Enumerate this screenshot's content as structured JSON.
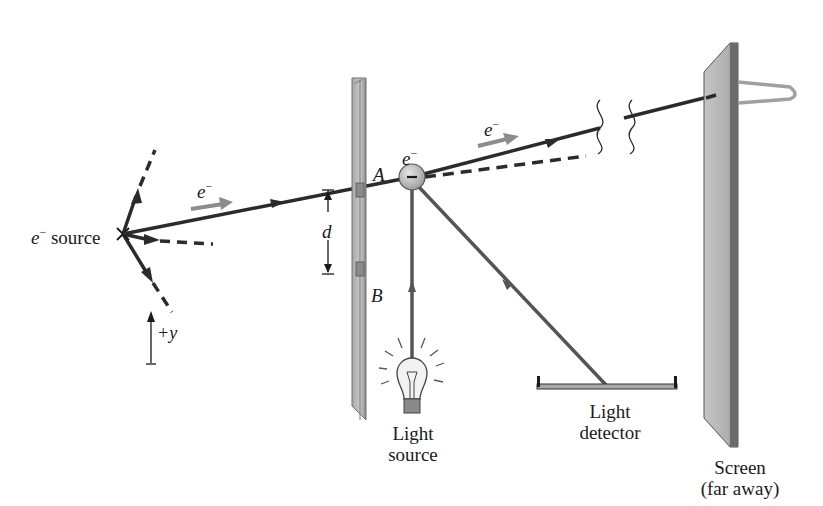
{
  "diagram": {
    "labels": {
      "source": {
        "symbol": "e",
        "superscript": "−",
        "text": "source"
      },
      "electron_incoming": {
        "symbol": "e",
        "superscript": "−"
      },
      "electron_at_detect": {
        "symbol": "e",
        "superscript": "−"
      },
      "electron_outgoing": {
        "symbol": "e",
        "superscript": "−"
      },
      "slit_a": "A",
      "slit_b": "B",
      "slit_separation": "d",
      "axis": "+y",
      "light_source_line1": "Light",
      "light_source_line2": "source",
      "light_detector_line1": "Light",
      "light_detector_line2": "detector",
      "screen_line1": "Screen",
      "screen_line2": "(far away)",
      "electron_charge_sign": "−"
    },
    "colors": {
      "line": "#2b2b2b",
      "arrow_gray": "#8c8c8c",
      "plate": "#b8b8b8",
      "plate_edge": "#6f6f6f",
      "electron": "#bdbdbd",
      "light_ray": "#555555"
    }
  }
}
